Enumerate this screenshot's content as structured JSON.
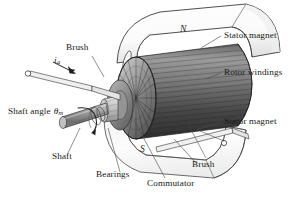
{
  "figure": {
    "background_color": "#ffffff",
    "ink_color": "#1a1a1a"
  },
  "poles": {
    "north": "N",
    "south": "S"
  },
  "labels": {
    "brush_top": "Brush",
    "brush_bottom": "Brush",
    "stator_magnet_top": "Stator magnet",
    "stator_magnet_bottom": "Stator magnet",
    "rotor_windings": "Rotor windings",
    "shaft_angle": "Shaft angle",
    "shaft_angle_symbol": "θ",
    "shaft_angle_subscript": "m",
    "current_symbol": "i",
    "current_subscript": "a",
    "shaft": "Shaft",
    "bearings": "Bearings",
    "commutator": "Commutator"
  },
  "colors": {
    "magnet_fill": "#fdfdfd",
    "magnet_shade": "#d8d8d8",
    "rotor_dark": "#3a3a3a",
    "rotor_mid": "#6e6e6e",
    "rotor_light": "#a8a8a8",
    "shaft_fill": "#9a9a9a",
    "line": "#2b2b2b",
    "leader": "#555555"
  }
}
